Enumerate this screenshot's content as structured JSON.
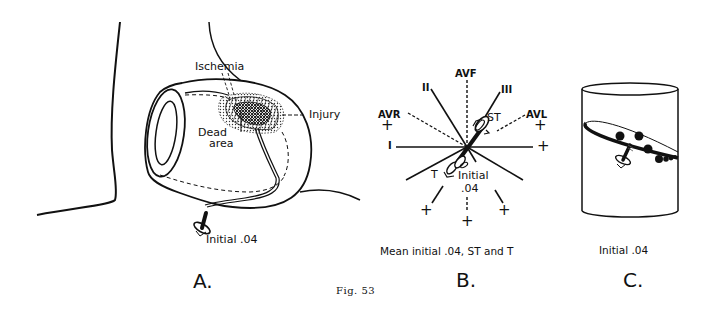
{
  "figure": {
    "caption": "Fig. 53",
    "colors": {
      "ink": "#111111",
      "background": "#ffffff"
    }
  },
  "panel_a": {
    "letter": "A.",
    "labels": {
      "ischemia": "Ischemia",
      "injury": "Injury",
      "dead_area_line1": "Dead",
      "dead_area_line2": "area",
      "vector": "Initial .04"
    }
  },
  "panel_b": {
    "letter": "B.",
    "caption": "Mean initial .04, ST and T",
    "leads": {
      "avf": "AVF",
      "ii": "II",
      "iii": "III",
      "avr": "AVR",
      "avl": "AVL",
      "i": "I"
    },
    "vectors": {
      "st": "ST",
      "t": "T",
      "initial_line1": "Initial",
      "initial_line2": ".04"
    },
    "pole_symbol": "+"
  },
  "panel_c": {
    "letter": "C.",
    "caption": "Initial .04"
  }
}
